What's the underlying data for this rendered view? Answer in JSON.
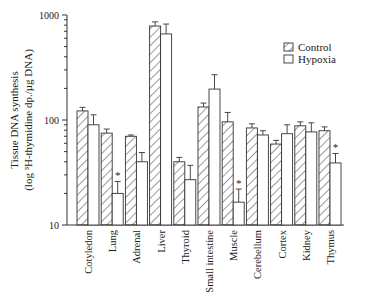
{
  "chart_data": {
    "type": "bar",
    "title": "",
    "xlabel": "",
    "ylabel": "Tissue DNA synthesis",
    "ylabel_line2": "(log ³H-thymidine dp./µg DNA)",
    "yscale": "log",
    "ylim": [
      10,
      1000
    ],
    "yticks": [
      10,
      100,
      1000
    ],
    "ytick_labels": [
      "10",
      "100",
      "1000"
    ],
    "grid": false,
    "legend_position": "upper right",
    "categories": [
      "Cotyledon",
      "Lung",
      "Adrenal",
      "Liver",
      "Thyroid",
      "Small intestine",
      "Muscle",
      "Cerebellum",
      "Cortex",
      "Kidney",
      "Thymus"
    ],
    "series": [
      {
        "name": "Control",
        "pattern": "hatched",
        "values": [
          122,
          75,
          70,
          785,
          40,
          133,
          96,
          84,
          59,
          88,
          79
        ],
        "error_upper": [
          132,
          82,
          72,
          860,
          44,
          145,
          118,
          92,
          64,
          96,
          86
        ]
      },
      {
        "name": "Hypoxia",
        "pattern": "open",
        "values": [
          90,
          20,
          40,
          660,
          27,
          197,
          16.5,
          72,
          74,
          77,
          39
        ],
        "error_upper": [
          112,
          26,
          49,
          820,
          37,
          270,
          22,
          79,
          90,
          94,
          48
        ],
        "significant": [
          false,
          true,
          false,
          false,
          false,
          false,
          true,
          false,
          false,
          false,
          true
        ]
      }
    ],
    "annotations": [
      "* marks significant difference vs control (Lung, Muscle, Thymus)"
    ]
  },
  "legend": {
    "items": [
      {
        "label": "Control",
        "pattern": "hatched"
      },
      {
        "label": "Hypoxia",
        "pattern": "open"
      }
    ]
  },
  "significance_marker": "*"
}
